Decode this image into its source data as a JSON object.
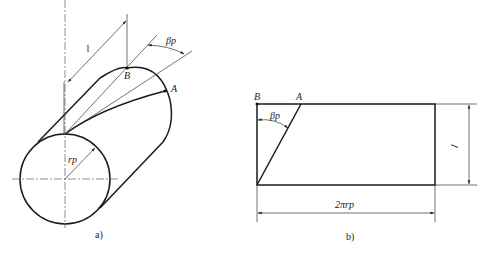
{
  "figure_a": {
    "caption": "a)",
    "labels": {
      "length": "l",
      "point_b": "B",
      "point_a": "A",
      "angle": "βp",
      "radius": "rp"
    }
  },
  "figure_b": {
    "caption": "b)",
    "labels": {
      "point_b": "B",
      "point_a": "A",
      "angle": "βp",
      "height": "l",
      "width": "2πrp"
    }
  },
  "colors": {
    "line": "#1a1a1a",
    "background": "#ffffff"
  }
}
